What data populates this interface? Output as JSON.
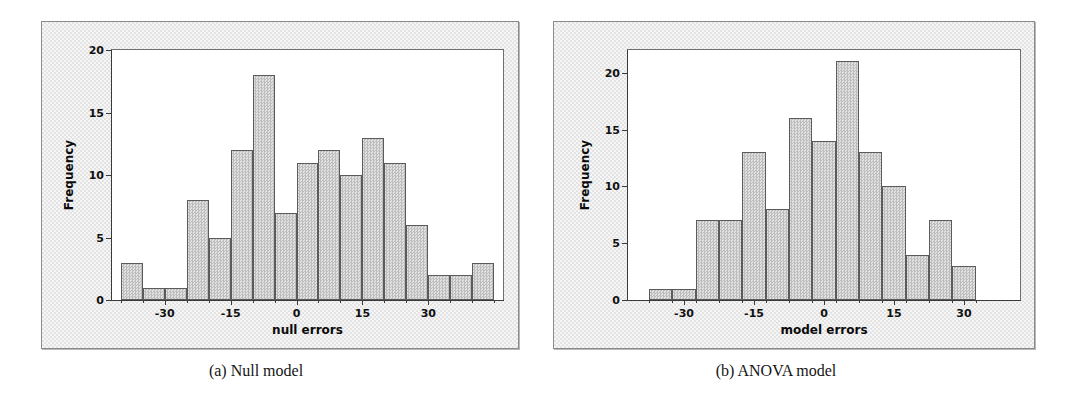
{
  "figure": {
    "panels": [
      {
        "id": "a",
        "caption": "(a) Null model",
        "xlabel": "null errors",
        "ylabel": "Frequency"
      },
      {
        "id": "b",
        "caption": "(b) ANOVA model",
        "xlabel": "model errors",
        "ylabel": "Frequency"
      }
    ]
  },
  "chart_data": [
    {
      "type": "bar",
      "title": "(a) Null model",
      "xlabel": "null errors",
      "ylabel": "Frequency",
      "bin_width": 5,
      "bin_left_edges": [
        -40,
        -35,
        -30,
        -25,
        -20,
        -15,
        -10,
        -5,
        0,
        5,
        10,
        15,
        20,
        25,
        30,
        35,
        40
      ],
      "bin_centers": [
        -37.5,
        -32.5,
        -27.5,
        -22.5,
        -17.5,
        -12.5,
        -7.5,
        -2.5,
        2.5,
        7.5,
        12.5,
        17.5,
        22.5,
        27.5,
        32.5,
        37.5,
        42.5
      ],
      "values": [
        3,
        1,
        1,
        8,
        5,
        12,
        18,
        7,
        11,
        12,
        10,
        13,
        11,
        6,
        2,
        2,
        3
      ],
      "categories": [
        "-40",
        "-35",
        "-30",
        "-25",
        "-20",
        "-15",
        "-10",
        "-5",
        "0",
        "5",
        "10",
        "15",
        "20",
        "25",
        "30",
        "35",
        "40"
      ],
      "xticks": [
        -30,
        -15,
        0,
        15,
        30
      ],
      "xtick_labels": [
        "-30",
        "-15",
        "0",
        "15",
        "30"
      ],
      "yticks": [
        0,
        5,
        10,
        15,
        20
      ],
      "ytick_labels": [
        "0",
        "5",
        "10",
        "15",
        "20"
      ],
      "xlim": [
        -42,
        47
      ],
      "ylim": [
        0,
        20
      ],
      "grid": false,
      "legend": "none",
      "total_count": 125
    },
    {
      "type": "bar",
      "title": "(b) ANOVA model",
      "xlabel": "model errors",
      "ylabel": "Frequency",
      "bin_width": 5,
      "bin_left_edges": [
        -37.5,
        -32.5,
        -27.5,
        -22.5,
        -17.5,
        -12.5,
        -7.5,
        -2.5,
        2.5,
        7.5,
        12.5,
        17.5,
        22.5,
        27.5
      ],
      "bin_centers": [
        -35,
        -30,
        -25,
        -20,
        -15,
        -10,
        -5,
        0,
        5,
        10,
        15,
        20,
        25,
        30
      ],
      "values": [
        1,
        1,
        7,
        7,
        13,
        8,
        16,
        14,
        21,
        13,
        10,
        4,
        7,
        3
      ],
      "categories": [
        "-35",
        "-30",
        "-25",
        "-20",
        "-15",
        "-10",
        "-5",
        "0",
        "5",
        "10",
        "15",
        "20",
        "25",
        "30"
      ],
      "xticks": [
        -30,
        -15,
        0,
        15,
        30
      ],
      "xtick_labels": [
        "-30",
        "-15",
        "0",
        "15",
        "30"
      ],
      "yticks": [
        0,
        5,
        10,
        15,
        20
      ],
      "ytick_labels": [
        "0",
        "5",
        "10",
        "15",
        "20"
      ],
      "xlim": [
        -42,
        42
      ],
      "ylim": [
        0,
        22
      ],
      "grid": false,
      "legend": "none",
      "total_count": 125
    }
  ]
}
